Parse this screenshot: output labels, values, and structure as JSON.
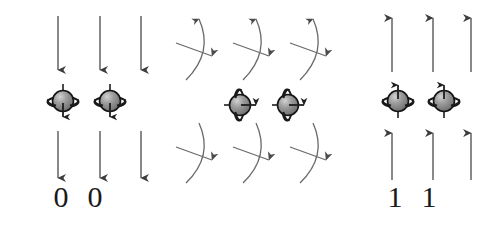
{
  "diagram": {
    "background_color": "#ffffff",
    "stroke_color": "#4a4a4a",
    "arrow_color": "#3c3c3c",
    "sphere_fill": "#8c8c8c",
    "sphere_highlight": "#c9c9c9",
    "sphere_outline": "#1a1a1a",
    "digit_color": "#1a1a1a"
  },
  "panels": {
    "left": {
      "name": "spin-down-panel",
      "label": "Spin down state",
      "field_arrow_direction": "down",
      "top_field_arrows": [
        {
          "x": 58,
          "y_start": 16,
          "y_end": 72
        },
        {
          "x": 100,
          "y_start": 16,
          "y_end": 72
        },
        {
          "x": 141,
          "y_start": 16,
          "y_end": 72
        }
      ],
      "bottom_field_arrows": [
        {
          "x": 58,
          "y_start": 131,
          "y_end": 180
        },
        {
          "x": 100,
          "y_start": 131,
          "y_end": 180
        },
        {
          "x": 141,
          "y_start": 131,
          "y_end": 180
        }
      ],
      "spins": [
        {
          "cx": 63,
          "cy": 101,
          "direction": "down"
        },
        {
          "cx": 110,
          "cy": 101,
          "direction": "down"
        }
      ],
      "digits": [
        "0",
        "0"
      ]
    },
    "middle": {
      "name": "rotation-wave-panel",
      "label": "Rotation / wave pulse",
      "wave_arrow_direction": "right",
      "top_waves": [
        {
          "x": 186,
          "y": 18
        },
        {
          "x": 243,
          "y": 18
        },
        {
          "x": 300,
          "y": 18
        }
      ],
      "bottom_waves": [
        {
          "x": 186,
          "y": 128
        },
        {
          "x": 243,
          "y": 128
        },
        {
          "x": 300,
          "y": 128
        }
      ],
      "spins": [
        {
          "cx": 240,
          "cy": 105,
          "direction": "right"
        },
        {
          "cx": 288,
          "cy": 105,
          "direction": "right"
        }
      ]
    },
    "right": {
      "name": "spin-up-panel",
      "label": "Spin up state",
      "field_arrow_direction": "up",
      "top_field_arrows": [
        {
          "x": 392,
          "y_start": 72,
          "y_end": 16
        },
        {
          "x": 433,
          "y_start": 72,
          "y_end": 16
        },
        {
          "x": 471,
          "y_start": 72,
          "y_end": 16
        }
      ],
      "bottom_field_arrows": [
        {
          "x": 392,
          "y_start": 180,
          "y_end": 131
        },
        {
          "x": 433,
          "y_start": 180,
          "y_end": 131
        },
        {
          "x": 471,
          "y_start": 180,
          "y_end": 131
        }
      ],
      "spins": [
        {
          "cx": 398,
          "cy": 101,
          "direction": "up"
        },
        {
          "cx": 444,
          "cy": 101,
          "direction": "up"
        }
      ],
      "digits": [
        "1",
        "1"
      ]
    }
  }
}
